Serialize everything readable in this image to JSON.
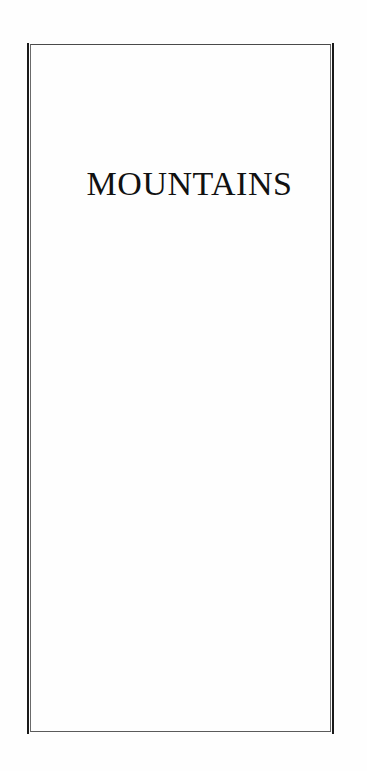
{
  "document": {
    "title": "MOUNTAINS"
  },
  "colors": {
    "frame": "#1a1a1a",
    "inner_rule": "#6a6a6a",
    "text": "#111111",
    "background": "#fefefe"
  }
}
